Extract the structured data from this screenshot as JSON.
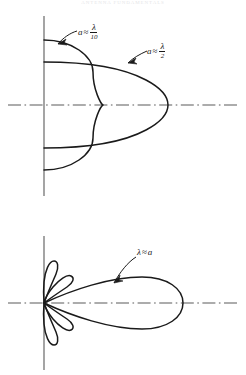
{
  "figure": {
    "header_text": "ANTENNA FUNDAMENTALS",
    "background_color": "#ffffff",
    "ink_color": "#1a1a1a",
    "axis_color": "#5a5a5a",
    "width": 246,
    "height": 375
  },
  "panels": [
    {
      "id": "upper-panel",
      "name": "small-aperture-patterns",
      "origin": {
        "x": 44,
        "y": 105
      },
      "vertical_axis": {
        "x": 44,
        "y_top": 16,
        "y_bottom": 196
      },
      "horizontal_axis": {
        "y": 105,
        "x_left": 8,
        "x_right": 238,
        "style": "dash-dot"
      },
      "labels": [
        {
          "id": "label-lambda-over-10",
          "name": "label-a-approx-lambda-over-10",
          "variable": "a",
          "relation": "≈",
          "numerator": "λ",
          "denominator": "10",
          "text_x": 78,
          "text_y": 24,
          "arrow": {
            "from_x": 77,
            "from_y": 32,
            "to_x": 58,
            "to_y": 44
          }
        },
        {
          "id": "label-lambda-over-2",
          "name": "label-a-approx-lambda-over-2",
          "variable": "a",
          "relation": "≈",
          "numerator": "λ",
          "denominator": "2",
          "text_x": 147,
          "text_y": 43,
          "arrow": {
            "from_x": 146,
            "from_y": 52,
            "to_x": 128,
            "to_y": 63
          }
        }
      ],
      "curves": [
        {
          "id": "curve-lambda-over-10",
          "name": "pattern-lobe-lambda-over-10",
          "description": "broad near-circular pattern, small aperture a = lambda/10",
          "extent_right": 128,
          "extent_top": 40,
          "extent_bottom": 170
        },
        {
          "id": "curve-lambda-over-2",
          "name": "pattern-lobe-lambda-over-2",
          "description": "narrower forward oval pattern, aperture a = lambda/2",
          "extent_right": 168,
          "extent_top": 62,
          "extent_bottom": 148
        }
      ]
    },
    {
      "id": "lower-panel",
      "name": "large-aperture-pattern",
      "origin": {
        "x": 44,
        "y": 303
      },
      "vertical_axis": {
        "x": 44,
        "y_top": 236,
        "y_bottom": 370
      },
      "horizontal_axis": {
        "y": 303,
        "x_left": 8,
        "x_right": 238,
        "style": "dash-dot"
      },
      "labels": [
        {
          "id": "label-lambda-approx-a",
          "name": "label-lambda-approx-a",
          "variable": "λ",
          "relation": "≈",
          "trailing": "a",
          "text_x": 137,
          "text_y": 252,
          "arrow": {
            "from_x": 136,
            "from_y": 258,
            "to_x": 114,
            "to_y": 283
          }
        }
      ],
      "curves": [
        {
          "id": "curve-main-lobe",
          "name": "main-lobe",
          "description": "long narrow main lobe, wavelength approximately equal to aperture",
          "extent_right": 183,
          "half_width": 28
        },
        {
          "id": "curve-side-lobes",
          "name": "side-lobes",
          "description": "two upper and two lower minor side lobes clustered at origin",
          "count": 4
        }
      ]
    }
  ]
}
